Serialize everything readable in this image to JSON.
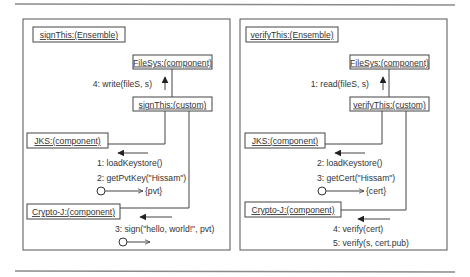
{
  "diagrams": [
    {
      "ensemble": "signThis:(Ensemble)",
      "filesys": "FileSys:(component)",
      "custom": "signThis:(custom)",
      "jks": "JKS:(component)",
      "crypto": "Crypto-J:(component)",
      "msg_filesys": "4: write(fileS, s)",
      "msg_jks_1": "1: loadKeystore()",
      "msg_jks_2": "2: getPvtKey(\"Hissam\")",
      "return_jks": "{pvt}",
      "msg_crypto_1": "3: sign(\"hello, world!\", pvt)",
      "msg_crypto_2": ""
    },
    {
      "ensemble": "verifyThis:(Ensemble)",
      "filesys": "FileSys:(component)",
      "custom": "verifyThis:(custom)",
      "jks": "JKS:(component)",
      "crypto": "Crypto-J:(component)",
      "msg_filesys": "1: read(fileS, s)",
      "msg_jks_1": "2: loadKeystore()",
      "msg_jks_2": "3: getCert(\"Hissam\")",
      "return_jks": "{cert}",
      "msg_crypto_1": "4: verify(cert)",
      "msg_crypto_2": "5: verify(s, cert.pub)"
    }
  ]
}
